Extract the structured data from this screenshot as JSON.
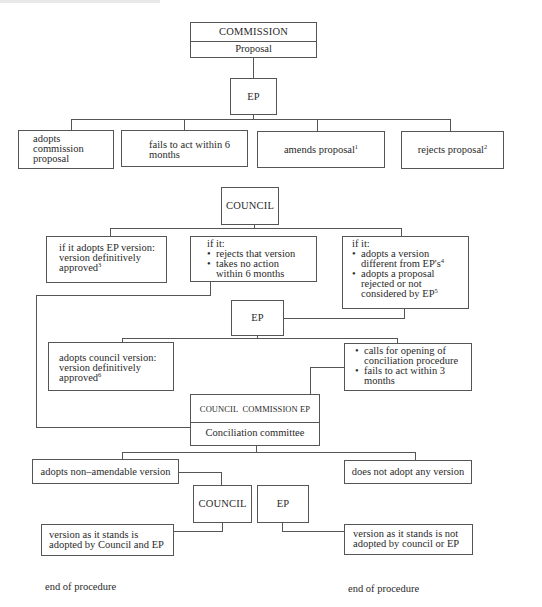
{
  "diagram": {
    "type": "flowchart",
    "commission": {
      "label": "COMMISSION",
      "sublabel": "Proposal"
    },
    "ep_first_reading": {
      "label": "EP"
    },
    "ep_options": [
      {
        "id": "adopts",
        "text": "adopts commission proposal"
      },
      {
        "id": "fails",
        "text": "fails to act within 6 months"
      },
      {
        "id": "amends",
        "text": "amends proposal",
        "footnote": "1"
      },
      {
        "id": "rejects",
        "text": "rejects proposal",
        "footnote": "2"
      }
    ],
    "council": {
      "label": "COUNCIL"
    },
    "council_options": [
      {
        "id": "adopts_ep",
        "line1": "if it adopts EP version:",
        "line2": "version definitively",
        "line3": "approved",
        "footnote": "3"
      },
      {
        "id": "rejects_or_no_action",
        "heading": "if it:",
        "bullets": [
          "rejects that version",
          "takes no action within 6 months"
        ]
      },
      {
        "id": "different",
        "heading": "if it:",
        "bullets": [
          "adopts a version different from EP's",
          "adopts a proposal rejected or not considered by EP"
        ],
        "footnotes": [
          "4",
          "5"
        ]
      }
    ],
    "ep_second": {
      "label": "EP"
    },
    "ep_second_options": [
      {
        "id": "adopts_council",
        "line1": "adopts council version:",
        "line2": "version definitively",
        "line3": "approved",
        "footnote": "6"
      },
      {
        "id": "conciliation",
        "bullets": [
          "calls for opening of conciliation procedure",
          "fails to act within 3 months"
        ]
      }
    ],
    "conciliation": {
      "members": "COUNCIL  COMMISSION EP",
      "label": "Conciliation committee"
    },
    "conciliation_options": [
      {
        "id": "adopts_nonamendable",
        "text": "adopts non–amendable version"
      },
      {
        "id": "no_version",
        "text": "does not adopt any version"
      }
    ],
    "final_bodies": [
      {
        "label": "COUNCIL"
      },
      {
        "label": "EP"
      }
    ],
    "outcomes": [
      {
        "id": "adopted",
        "line1": "version as it stands is",
        "line2": "adopted by Council and EP"
      },
      {
        "id": "not_adopted",
        "line1": "version as it stands is not",
        "line2": "adopted by council or EP"
      }
    ],
    "end_labels": [
      "end of procedure",
      "end of procedure"
    ]
  }
}
